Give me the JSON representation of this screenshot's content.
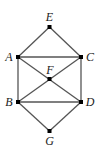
{
  "diagram": {
    "type": "graph",
    "nodes": [
      {
        "id": "E",
        "label": "E",
        "x": 49.5,
        "y": 27,
        "lx": 49.5,
        "ly": 21,
        "anchor": "middle"
      },
      {
        "id": "A",
        "label": "A",
        "x": 18,
        "y": 57,
        "lx": 9,
        "ly": 61,
        "anchor": "middle"
      },
      {
        "id": "C",
        "label": "C",
        "x": 81,
        "y": 57,
        "lx": 90,
        "ly": 61,
        "anchor": "middle"
      },
      {
        "id": "F",
        "label": "F",
        "x": 49.5,
        "y": 79,
        "lx": 50,
        "ly": 74,
        "anchor": "middle"
      },
      {
        "id": "B",
        "label": "B",
        "x": 18,
        "y": 102,
        "lx": 9,
        "ly": 106,
        "anchor": "middle"
      },
      {
        "id": "D",
        "label": "D",
        "x": 81,
        "y": 102,
        "lx": 90,
        "ly": 106,
        "anchor": "middle"
      },
      {
        "id": "G",
        "label": "G",
        "x": 49.5,
        "y": 131,
        "lx": 49.5,
        "ly": 145,
        "anchor": "middle"
      }
    ],
    "edges": [
      [
        "E",
        "A"
      ],
      [
        "E",
        "C"
      ],
      [
        "A",
        "C"
      ],
      [
        "A",
        "B"
      ],
      [
        "C",
        "D"
      ],
      [
        "A",
        "D"
      ],
      [
        "C",
        "B"
      ],
      [
        "B",
        "D"
      ],
      [
        "B",
        "G"
      ],
      [
        "D",
        "G"
      ]
    ],
    "colors": {
      "edge": "#555555",
      "node": "#000000",
      "label": "#222222"
    }
  }
}
